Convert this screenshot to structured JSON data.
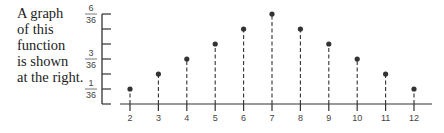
{
  "caption": {
    "lines": [
      "A graph",
      "of this",
      "function",
      "is shown",
      "at the right."
    ]
  },
  "chart_data": {
    "type": "scatter",
    "style": "stem plot with dashed vertical lines from x-axis to each point",
    "title": "",
    "xlabel": "",
    "ylabel": "",
    "x": [
      2,
      3,
      4,
      5,
      6,
      7,
      8,
      9,
      10,
      11,
      12
    ],
    "values_numerator": [
      1,
      2,
      3,
      4,
      5,
      6,
      5,
      4,
      3,
      2,
      1
    ],
    "denominator": 36,
    "values": [
      0.0278,
      0.0556,
      0.0833,
      0.1111,
      0.1389,
      0.1667,
      0.1389,
      0.1111,
      0.0833,
      0.0556,
      0.0278
    ],
    "x_tick_labels": [
      "2",
      "3",
      "4",
      "5",
      "6",
      "7",
      "8",
      "9",
      "10",
      "11",
      "12"
    ],
    "y_ticks": [
      1,
      2,
      3,
      4,
      5,
      6
    ],
    "y_tick_labels": [
      {
        "value": 1,
        "num": "1",
        "den": "36"
      },
      {
        "value": 3,
        "num": "3",
        "den": "36"
      },
      {
        "value": 6,
        "num": "6",
        "den": "36"
      }
    ],
    "ylim": [
      0,
      0.1667
    ],
    "grid": false,
    "legend": null
  }
}
